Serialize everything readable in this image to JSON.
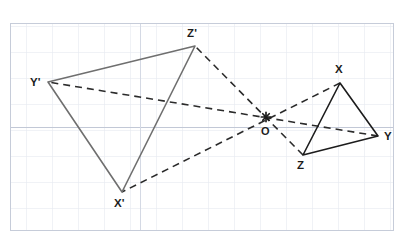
{
  "figure": {
    "background_color": "#ffffff",
    "grid": {
      "visible": true,
      "left": 10,
      "top": 23,
      "right": 394,
      "bottom": 231,
      "cell_size": 26,
      "minor_color": "#dfe3ec",
      "major_color": "#b9c0cf",
      "border_color": "#c3c9d6"
    },
    "styles": {
      "image_triangle_color": "#6f6f6f",
      "object_triangle_color": "#1c1c1c",
      "ray_color": "#2b2b2b",
      "ray_dash": "7 5",
      "solid_width": 1.6,
      "ray_width": 1.6,
      "label_color": "#1c1c1c"
    },
    "centre": {
      "name": "O",
      "label": "O",
      "x": 266,
      "y": 117,
      "marker": "asterisk-marker",
      "label_x": 261,
      "label_y": 126
    },
    "object_triangle": {
      "name": "triangle-XYZ",
      "style": "solid",
      "color": "#1c1c1c",
      "vertices": [
        {
          "name": "X",
          "label": "X",
          "x": 340,
          "y": 83,
          "label_x": 335,
          "label_y": 64
        },
        {
          "name": "Y",
          "label": "Y",
          "x": 378,
          "y": 136,
          "label_x": 384,
          "label_y": 131
        },
        {
          "name": "Z",
          "label": "Z",
          "x": 303,
          "y": 155,
          "label_x": 297,
          "label_y": 160
        }
      ]
    },
    "image_triangle": {
      "name": "triangle-X-prime-Y-prime-Z-prime",
      "style": "solid",
      "color": "#6f6f6f",
      "vertices": [
        {
          "name": "X'",
          "label": "X'",
          "x": 122,
          "y": 192,
          "label_x": 114,
          "label_y": 198
        },
        {
          "name": "Y'",
          "label": "Y'",
          "x": 48,
          "y": 82,
          "label_x": 30,
          "label_y": 77
        },
        {
          "name": "Z'",
          "label": "Z'",
          "x": 195,
          "y": 46,
          "label_x": 187,
          "label_y": 28
        }
      ]
    },
    "rays": [
      {
        "name": "ray-X-to-X-prime",
        "from": "X",
        "to": "X'",
        "style": "dashed"
      },
      {
        "name": "ray-Y-to-Y-prime",
        "from": "Y",
        "to": "Y'",
        "style": "dashed"
      },
      {
        "name": "ray-Z-to-Z-prime",
        "from": "Z",
        "to": "Z'",
        "style": "dashed"
      }
    ]
  }
}
